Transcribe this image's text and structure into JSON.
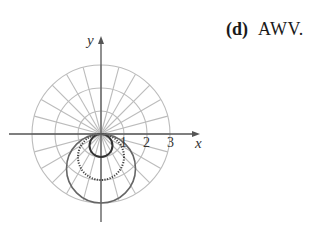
{
  "caption": {
    "label": "(d)",
    "answer": "AWV."
  },
  "colors": {
    "grid": "#bcbcbc",
    "axis": "#555555",
    "curve_solid": "#333333",
    "curve_large": "#666666",
    "curve_dotted": "#444444"
  },
  "chart_data": {
    "type": "polar",
    "title": "",
    "xlabel": "x",
    "ylabel": "y",
    "grid": {
      "circles_r": [
        1,
        2,
        3
      ],
      "radial_spacing_deg": 15
    },
    "x_ticks": [
      "1",
      "2",
      "3"
    ],
    "series": [
      {
        "name": "small circle",
        "style": "solid",
        "equation": "r = -sin(theta)",
        "diameter": 1
      },
      {
        "name": "middle circle",
        "style": "dotted",
        "equation": "r = -2 sin(theta)",
        "diameter": 2
      },
      {
        "name": "large circle",
        "style": "solid",
        "equation": "r = -3 sin(theta)",
        "diameter": 3
      }
    ]
  }
}
